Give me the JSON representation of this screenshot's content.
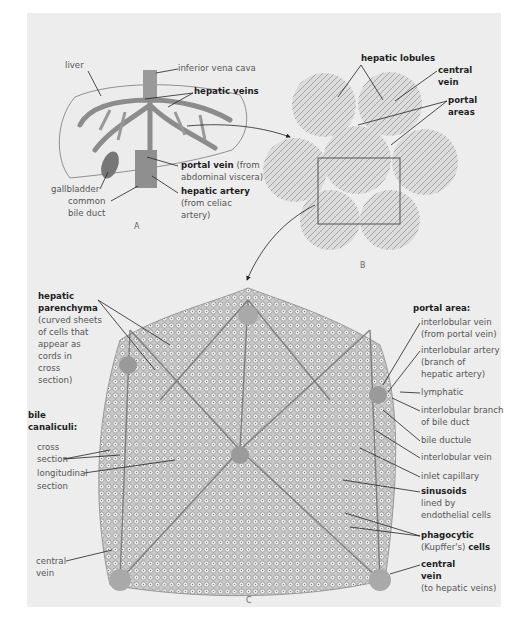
{
  "figure": {
    "background_color": "#ededed",
    "caption_partial": "Fig. — (caption cut off at bottom edge)"
  },
  "panel_a": {
    "letter": "A",
    "labels": {
      "liver": "liver",
      "inferior_vena_cava": "inferior vena cava",
      "hepatic_veins": "hepatic veins",
      "portal_vein_bold": "portal vein",
      "portal_vein_note_1": "(from",
      "portal_vein_note_2": "abdominal viscera)",
      "hepatic_artery_bold": "hepatic artery",
      "hepatic_artery_note_1": "(from celiac",
      "hepatic_artery_note_2": "artery)",
      "gallbladder": "gallbladder",
      "common_bile_duct_1": "common",
      "common_bile_duct_2": "bile duct"
    }
  },
  "panel_b": {
    "letter": "B",
    "labels": {
      "hepatic_lobules": "hepatic lobules",
      "central_vein_1": "central",
      "central_vein_2": "vein",
      "portal_areas_1": "portal",
      "portal_areas_2": "areas"
    }
  },
  "panel_c": {
    "letter": "C",
    "left_labels": {
      "hepatic_parenchyma_1": "hepatic",
      "hepatic_parenchyma_2": "parenchyma",
      "parenchyma_note": [
        "(curved sheets",
        "of cells that",
        "appear as",
        "cords in",
        "cross",
        "section)"
      ],
      "bile_canaliculi_1": "bile",
      "bile_canaliculi_2": "canaliculi:",
      "cross_section_1": "cross",
      "cross_section_2": "section",
      "longitudinal_1": "longitudinal",
      "longitudinal_2": "section",
      "central_vein_1": "central",
      "central_vein_2": "vein"
    },
    "right_labels": {
      "portal_area": "portal area:",
      "interlobular_vein_1": "interlobular vein",
      "interlobular_vein_2": "(from portal vein)",
      "interlobular_artery_1": "interlobular artery",
      "interlobular_artery_2": "(branch of",
      "interlobular_artery_3": "hepatic artery)",
      "lymphatic": "lymphatic",
      "interlobular_branch_1": "interlobular branch",
      "interlobular_branch_2": "of bile duct",
      "bile_ductule": "bile ductule",
      "interlobular_vein_b": "interlobular vein",
      "inlet_capillary": "inlet capillary",
      "sinusoids_bold": "sinusoids",
      "sinusoids_note_1": "lined by",
      "sinusoids_note_2": "endothelial cells",
      "phagocytic_bold": "phagocytic",
      "kupffer_note": "(Kupffer's)",
      "cells_bold": "cells",
      "central_vein_1": "central",
      "central_vein_2": "vein",
      "central_vein_note": "(to hepatic veins)"
    }
  }
}
